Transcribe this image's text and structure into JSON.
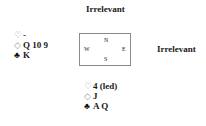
{
  "north": {
    "label": "Irrelevant"
  },
  "east": {
    "label": "Irrelevant"
  },
  "compass": {
    "n": "N",
    "w": "W",
    "e": "E",
    "s": "S"
  },
  "west": {
    "hearts": {
      "symbol": "♡",
      "cards": "-"
    },
    "diamonds": {
      "symbol": "◇",
      "cards": "Q 10 9"
    },
    "clubs": {
      "symbol": "♣",
      "cards": "K"
    }
  },
  "south": {
    "hearts": {
      "symbol": "♡",
      "cards": "4 (led)"
    },
    "diamonds": {
      "symbol": "◇",
      "cards": "J"
    },
    "clubs": {
      "symbol": "♣",
      "cards": "A Q"
    }
  },
  "colors": {
    "red_suit": "#999999",
    "black_suit": "#111111",
    "border": "#8a8a8a"
  }
}
